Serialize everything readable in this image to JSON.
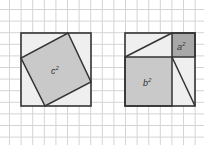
{
  "grid": {
    "spacing": 11.6,
    "color": "#d4d4d4"
  },
  "colors": {
    "background": "#ffffff",
    "outline": "#333333",
    "light_fill": "#eeeeee",
    "medium_fill": "#c8c8c8",
    "dark_fill": "#a9a9a9"
  },
  "left_figure": {
    "label": "c",
    "exponent": "2",
    "description": "Tilted square c² inside outer square with four corner triangles"
  },
  "right_figure": {
    "small_square": {
      "label": "a",
      "exponent": "2"
    },
    "large_square": {
      "label": "b",
      "exponent": "2"
    },
    "description": "Outer square split into a², b² and two rectangles each divided into two triangles"
  }
}
